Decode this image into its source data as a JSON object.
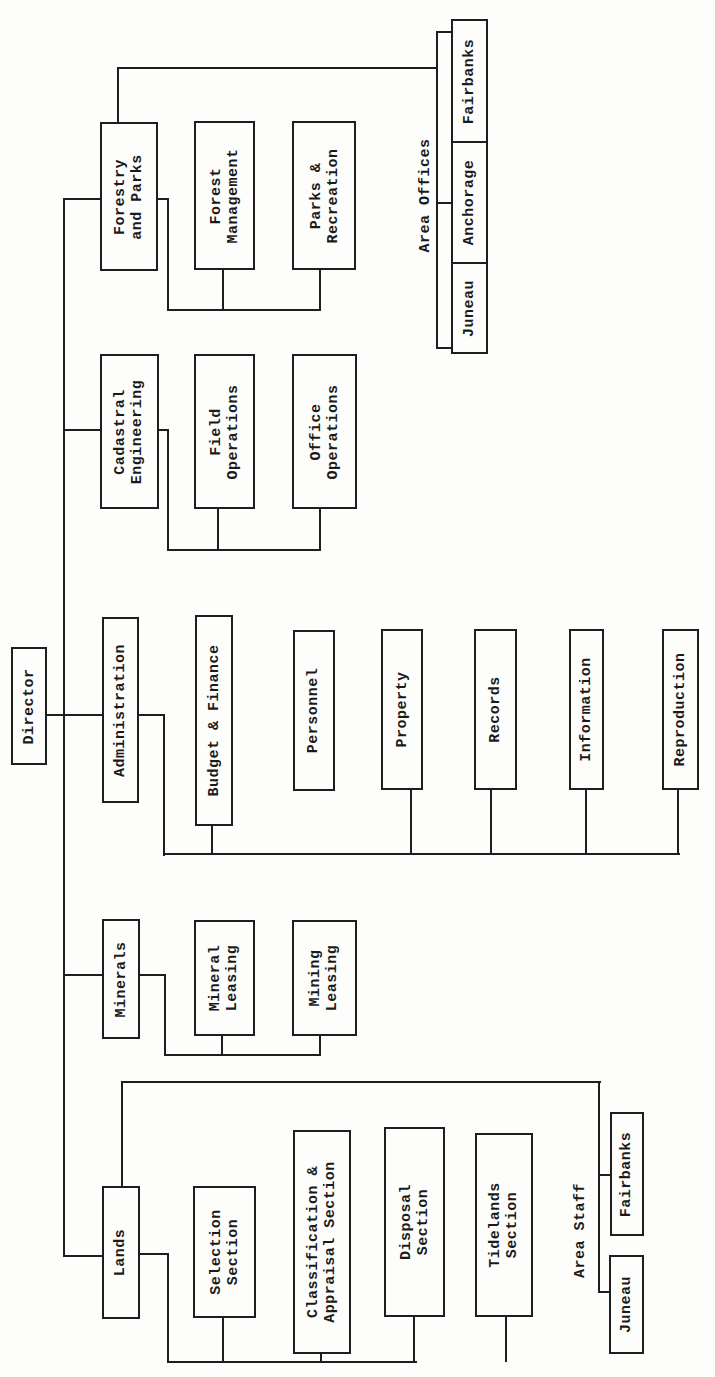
{
  "chart_title": "",
  "director": {
    "label": "Director"
  },
  "divisions": {
    "forestry": {
      "label": "Forestry\nand Parks",
      "children": [
        "Forest\nManagement",
        "Parks &\nRecreation"
      ],
      "area_offices": {
        "label": "Area Offices",
        "offices": [
          "Fairbanks",
          "Anchorage",
          "Juneau"
        ]
      }
    },
    "cadastral": {
      "label": "Cadastral\nEngineering",
      "children": [
        "Field\nOperations",
        "Office\nOperations"
      ]
    },
    "administration": {
      "label": "Administration",
      "children": [
        "Budget & Finance",
        "Personnel",
        "Property",
        "Records",
        "Information",
        "Reproduction"
      ]
    },
    "minerals": {
      "label": "Minerals",
      "children": [
        "Mineral\nLeasing",
        "Mining\nLeasing"
      ]
    },
    "lands": {
      "label": "Lands",
      "children": [
        "Selection\nSection",
        "Classification &\nAppraisal Section",
        "Disposal\nSection",
        "Tidelands\nSection"
      ],
      "area_staff": {
        "label": "Area Staff",
        "offices": [
          "Fairbanks",
          "Juneau"
        ]
      }
    }
  }
}
